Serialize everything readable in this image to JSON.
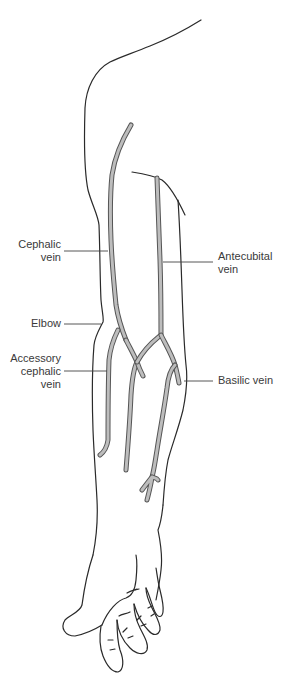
{
  "figure": {
    "colors": {
      "outline": "#2a2a2a",
      "vein_fill": "#bdbdbd",
      "vein_edge": "#555555",
      "label_text": "#3a3a3a",
      "background": "#ffffff"
    }
  },
  "labels": {
    "cephalic_vein": {
      "line1": "Cephalic",
      "line2": "vein"
    },
    "elbow": {
      "line1": "Elbow"
    },
    "accessory_cephalic_vein": {
      "line1": "Accessory",
      "line2": "cephalic",
      "line3": "vein"
    },
    "antecubital_vein": {
      "line1": "Antecubital",
      "line2": "vein"
    },
    "basilic_vein": {
      "line1": "Basilic vein"
    }
  }
}
